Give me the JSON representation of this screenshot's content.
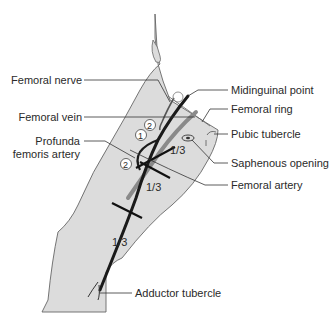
{
  "figure": {
    "type": "anatomical-diagram",
    "colors": {
      "skin_fill": "#dcdcdc",
      "outline": "#555555",
      "artery": "#1a1a1a",
      "vein": "#7a7a7a",
      "text": "#2a2a2a"
    }
  },
  "labels": {
    "femoral_nerve": "Femoral nerve",
    "femoral_vein": "Femoral vein",
    "profunda_line1": "Profunda",
    "profunda_line2": "femoris artery",
    "midinguinal_point": "Midinguinal point",
    "femoral_ring": "Femoral ring",
    "pubic_tubercle": "Pubic tubercle",
    "saphenous_opening": "Saphenous opening",
    "femoral_artery": "Femoral artery",
    "adductor_tubercle": "Adductor tubercle"
  },
  "segments": {
    "upper": "1/3",
    "middle": "1/3",
    "lower": "1/3"
  },
  "markers": {
    "circle_1": "1",
    "circle_2a": "2",
    "circle_2b": "2"
  }
}
